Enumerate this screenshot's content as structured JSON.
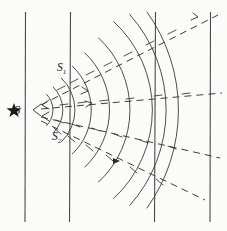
{
  "figure": {
    "background_color": "#fbfbf9",
    "line_color": "#3a3a3a",
    "labels": {
      "source": "S",
      "ray_upper": "S",
      "ray_upper_sub": "1",
      "ray_lower": "S",
      "ray_lower_sub": "2"
    },
    "markers": {
      "source_marker": "star"
    },
    "geometry": {
      "source_x": 31,
      "source_y": 110,
      "vertical_lines_x": [
        25,
        70,
        155,
        210
      ],
      "vertical_line_top": 12,
      "vertical_line_bottom": 222,
      "ray_upper_angle_deg": -27,
      "ray_middle_angle_deg": -5,
      "ray_lower_angle_deg": 22,
      "ray_lowest_angle_deg": 42,
      "arc_radii": [
        22,
        32,
        44,
        60,
        78,
        98,
        120,
        143,
        168
      ],
      "arc_half_angle_deg": 46
    }
  }
}
